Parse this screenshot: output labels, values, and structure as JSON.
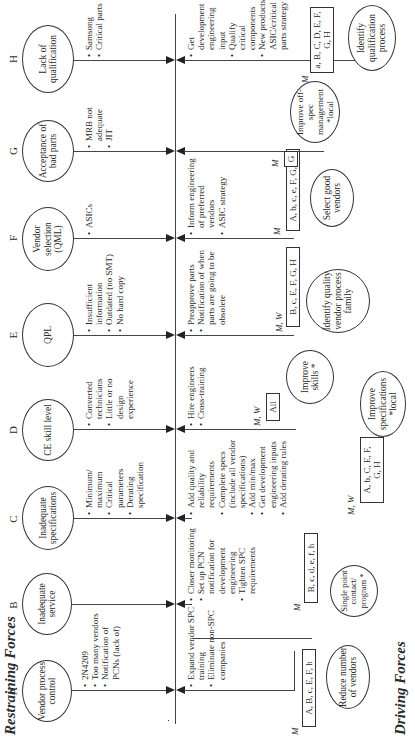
{
  "titles": {
    "restraining": "Restraining Forces",
    "driving": "Driving Forces"
  },
  "restraining_forces": [
    {
      "letter": "A",
      "label": "Vendor process control",
      "bullets": [
        "2N4209",
        "Too many vendors",
        "Notification of PCNs (lack of)"
      ]
    },
    {
      "letter": "B",
      "label": "Inadequate service",
      "bullets": []
    },
    {
      "letter": "C",
      "label": "Inadequate specifications",
      "bullets": [
        "Minimum/ maximum",
        "Critical parameters",
        "Derating specification"
      ]
    },
    {
      "letter": "D",
      "label": "CE skill level",
      "bullets": [
        "Converted technicians",
        "Little or no design experience"
      ]
    },
    {
      "letter": "E",
      "label": "QPL",
      "bullets": [
        "Insufficient information",
        "Outdated (no SMT)",
        "No hard copy"
      ]
    },
    {
      "letter": "F",
      "label": "Vendor selection (QML)",
      "bullets": [
        "ASICs"
      ]
    },
    {
      "letter": "G",
      "label": "Acceptance of bad parts",
      "bullets": [
        "MRB not adequate",
        "JIT"
      ]
    },
    {
      "letter": "H",
      "label": "Lack of qualification",
      "bullets": [
        "Samsong",
        "Critical parts"
      ]
    }
  ],
  "driving_forces": [
    {
      "bullets": [
        "Expand vendor SPC training",
        "Eliminate non-SPC companies"
      ],
      "marker": "M",
      "box": "A, B, c, E, F, h",
      "label": "Reduce number of vendors"
    },
    {
      "bullets": [
        "Closer monitoring",
        "Set up PCN notification for development engineering",
        "Tighten SPC requirements"
      ],
      "marker": "M",
      "box": "B, c, d, e, f, h",
      "label": "Single point contact/ program *"
    },
    {
      "bullets": [
        "Add quality and reliability requirements",
        "Complete specs (include all vendor specifications)",
        "Add min/max",
        "Get development engineering inputs",
        "Add derating rules"
      ],
      "marker": "M, W",
      "box": "A, b, C, E, F, G, H",
      "label": "Improve specifications *local"
    },
    {
      "bullets": [
        "Hire engineers",
        "Cross-training"
      ],
      "marker": "M, W",
      "box": "All",
      "label": "Improve skills *"
    },
    {
      "bullets": [
        "Preapprove parts",
        "Notification of when parts are going to be obsolete"
      ],
      "marker": "M, W",
      "box": "B, c, E, F, G, H",
      "label": "Identify quality vendor process family"
    },
    {
      "bullets": [
        "Inform engineering of preferred vendors",
        "ASIC strategy"
      ],
      "marker": "M",
      "box": "A, b, c, e, F, G, H",
      "label": "Select good vendors"
    },
    {
      "bullets": [],
      "marker": "M",
      "box": "G",
      "label": "Improve off-spec management *local"
    },
    {
      "bullets": [
        "Get development engineering input",
        "Qualify critical components",
        "New products ASIC/critical parts strategy"
      ],
      "marker": "M",
      "box": "a, B, C, D, E, F, G, H",
      "label": "Identify qualification process"
    }
  ]
}
